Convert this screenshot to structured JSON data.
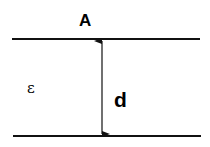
{
  "diagram": {
    "labels": {
      "area": "A",
      "permittivity": "ε",
      "separation": "d"
    },
    "colors": {
      "stroke": "#111111",
      "background": "#ffffff"
    }
  }
}
